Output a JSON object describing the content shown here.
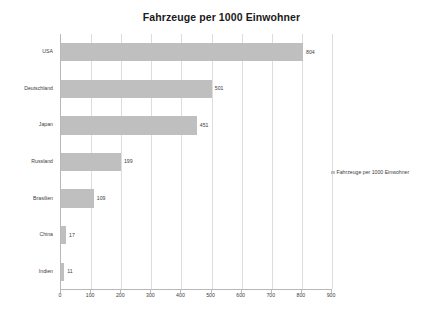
{
  "chart_data": {
    "type": "bar",
    "orientation": "horizontal",
    "title": "Fahrzeuge per 1000 Einwohner",
    "xlabel": "",
    "ylabel": "",
    "categories": [
      "USA",
      "Deutschland",
      "Japan",
      "Russland",
      "Brasilien",
      "China",
      "Indien"
    ],
    "values": [
      804,
      501,
      451,
      199,
      109,
      17,
      11
    ],
    "data_labels": [
      "804",
      "501",
      "451",
      "199",
      "109",
      "17",
      "11"
    ],
    "series": [
      {
        "name": "Fahrzeuge per 1000 Einwohner",
        "values": [
          804,
          501,
          451,
          199,
          109,
          17,
          11
        ]
      }
    ],
    "xlim": [
      0,
      900
    ],
    "xticks": [
      0,
      100,
      200,
      300,
      400,
      500,
      600,
      700,
      800,
      900
    ],
    "xtick_labels": [
      "0",
      "100",
      "200",
      "300",
      "400",
      "500",
      "600",
      "700",
      "800",
      "900"
    ],
    "grid": "vertical",
    "legend": {
      "position": "right",
      "entries": [
        "Fahrzeuge per 1000 Einwohner"
      ]
    },
    "colors": {
      "bar": "#bfbfbf",
      "gridline": "#dddddd",
      "axis": "#b8b8b8",
      "text": "#3d3d3d",
      "title": "#1a1a1a",
      "background": "#ffffff"
    }
  }
}
